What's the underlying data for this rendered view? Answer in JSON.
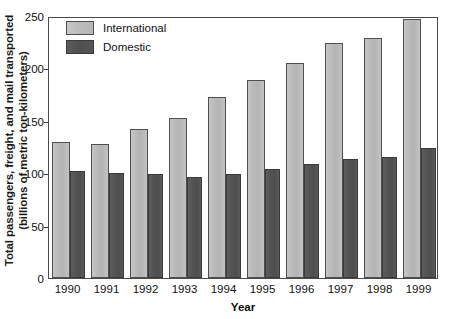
{
  "chart_data": {
    "type": "bar",
    "title": "",
    "xlabel": "Year",
    "ylabel": "Total passengers, freight, and mail transported (billions of metric ton-kilometers)",
    "ylabel_line1": "Total passengers, freight, and mail transported",
    "ylabel_line2": "(billions of metric ton-kilometers)",
    "categories": [
      "1990",
      "1991",
      "1992",
      "1993",
      "1994",
      "1995",
      "1996",
      "1997",
      "1998",
      "1999"
    ],
    "series": [
      {
        "name": "International",
        "color": "#bdbdbd",
        "values": [
          130,
          128,
          142,
          153,
          173,
          189,
          205,
          224,
          229,
          247
        ]
      },
      {
        "name": "Domestic",
        "color": "#545454",
        "values": [
          102,
          100,
          99,
          96,
          99,
          104,
          109,
          114,
          115,
          124
        ]
      }
    ],
    "ylim": [
      0,
      250
    ],
    "yticks": [
      0,
      50,
      100,
      150,
      200,
      250
    ],
    "ytick_labels": [
      "0",
      "50",
      "100",
      "150",
      "200",
      "250"
    ],
    "grid": false,
    "legend_position": "top-left",
    "legend_entries": [
      "International",
      "Domestic"
    ]
  }
}
